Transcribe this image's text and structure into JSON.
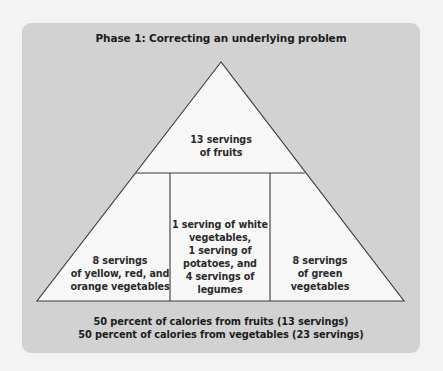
{
  "title": "Phase 1: Correcting an underlying problem",
  "pyramid": {
    "top": {
      "lines": [
        "13 servings",
        "of fruits"
      ]
    },
    "bottom_left": {
      "lines": [
        "8 servings",
        "of yellow, red, and",
        "orange vegetables"
      ]
    },
    "bottom_middle": {
      "lines": [
        "1 serving of white",
        "vegetables,",
        "1 serving of",
        "potatoes, and",
        "4 servings of",
        "legumes"
      ]
    },
    "bottom_right": {
      "lines": [
        "8 servings",
        "of green",
        "vegetables"
      ]
    }
  },
  "footer": {
    "lines": [
      "50 percent of calories from fruits (13 servings)",
      "50 percent of calories from vegetables (23 servings)"
    ]
  },
  "colors": {
    "page_background": "#f3f3f3",
    "panel_background": "#d2d2d2",
    "pyramid_fill": "#f8f8f8",
    "line_color": "#3a3a3a"
  }
}
